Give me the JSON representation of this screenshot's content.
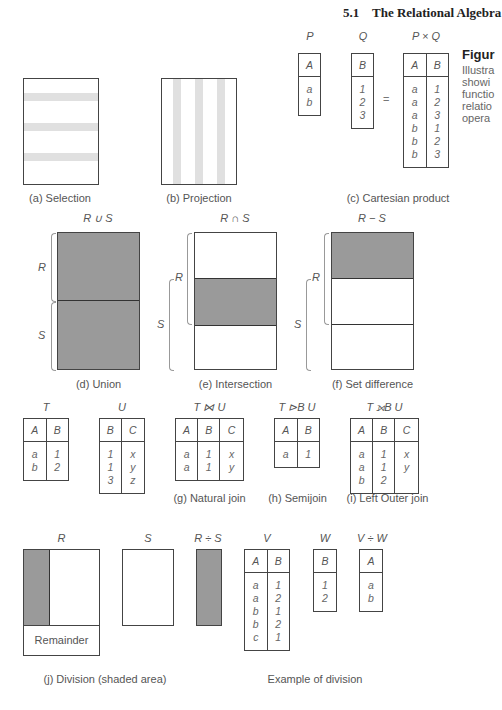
{
  "header": {
    "section": "5.1",
    "title": "The Relational Algebra"
  },
  "figure_caption": {
    "title": "Figur",
    "lines": [
      "Illustra",
      "showi",
      "functio",
      "relatio",
      "opera"
    ]
  },
  "panels": {
    "a": {
      "caption": "(a) Selection"
    },
    "b": {
      "caption": "(b) Projection"
    },
    "c": {
      "caption": "(c) Cartesian product",
      "equals": "=",
      "P": {
        "name": "P",
        "headers": [
          "A"
        ],
        "rows": [
          [
            "a"
          ],
          [
            "b"
          ]
        ]
      },
      "Q": {
        "name": "Q",
        "headers": [
          "B"
        ],
        "rows": [
          [
            "1"
          ],
          [
            "2"
          ],
          [
            "3"
          ]
        ]
      },
      "PxQ": {
        "name": "P × Q",
        "headers": [
          "A",
          "B"
        ],
        "rows": [
          [
            "a",
            "1"
          ],
          [
            "a",
            "2"
          ],
          [
            "a",
            "3"
          ],
          [
            "b",
            "1"
          ],
          [
            "b",
            "2"
          ],
          [
            "b",
            "3"
          ]
        ]
      }
    },
    "d": {
      "caption": "(d) Union",
      "title": "R ∪ S",
      "r_label": "R",
      "s_label": "S"
    },
    "e": {
      "caption": "(e) Intersection",
      "title": "R ∩ S",
      "r_label": "R",
      "s_label": "S"
    },
    "f": {
      "caption": "(f) Set difference",
      "title": "R − S",
      "r_label": "R",
      "s_label": "S"
    },
    "joins": {
      "T": {
        "name": "T",
        "headers": [
          "A",
          "B"
        ],
        "rows": [
          [
            "a",
            "1"
          ],
          [
            "b",
            "2"
          ]
        ]
      },
      "U": {
        "name": "U",
        "headers": [
          "B",
          "C"
        ],
        "rows": [
          [
            "1",
            "x"
          ],
          [
            "1",
            "y"
          ],
          [
            "3",
            "z"
          ]
        ]
      },
      "g": {
        "caption": "(g) Natural join",
        "name": "T ⋈ U",
        "headers": [
          "A",
          "B",
          "C"
        ],
        "rows": [
          [
            "a",
            "1",
            "x"
          ],
          [
            "a",
            "1",
            "y"
          ]
        ]
      },
      "h": {
        "caption": "(h) Semijoin",
        "name": "T ⊳B U",
        "headers": [
          "A",
          "B"
        ],
        "rows": [
          [
            "a",
            "1"
          ]
        ]
      },
      "i": {
        "caption": "(i) Left Outer join",
        "name": "T ⟕B U",
        "headers": [
          "A",
          "B",
          "C"
        ],
        "rows": [
          [
            "a",
            "1",
            "x"
          ],
          [
            "a",
            "1",
            "y"
          ],
          [
            "b",
            "2",
            ""
          ]
        ]
      }
    },
    "j": {
      "caption": "(j) Division (shaded area)",
      "r_title": "R",
      "s_title": "S",
      "rs_title": "R ÷ S",
      "remainder": "Remainder"
    },
    "division_example": {
      "caption": "Example of division",
      "V": {
        "name": "V",
        "headers": [
          "A",
          "B"
        ],
        "rows": [
          [
            "a",
            "1"
          ],
          [
            "a",
            "2"
          ],
          [
            "b",
            "1"
          ],
          [
            "b",
            "2"
          ],
          [
            "c",
            "1"
          ]
        ]
      },
      "W": {
        "name": "W",
        "headers": [
          "B"
        ],
        "rows": [
          [
            "1"
          ],
          [
            "2"
          ]
        ]
      },
      "VW": {
        "name": "V ÷ W",
        "headers": [
          "A"
        ],
        "rows": [
          [
            "a"
          ],
          [
            "b"
          ]
        ]
      }
    }
  }
}
